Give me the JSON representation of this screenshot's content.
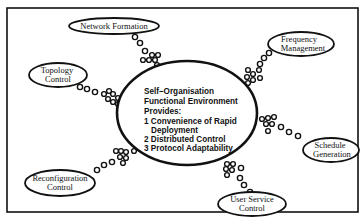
{
  "diagram": {
    "type": "hub-and-spoke",
    "center": {
      "title_lines": [
        "Self–Organisation",
        "Functional Environment",
        "Provides:"
      ],
      "items": [
        {
          "number": "1",
          "lines": [
            "Convenience of Rapid",
            "Deployment"
          ]
        },
        {
          "number": "2",
          "lines": [
            "Distributed Control"
          ]
        },
        {
          "number": "3",
          "lines": [
            "Protocol Adaptability"
          ]
        }
      ],
      "text_lines": [
        "Self–Organisation",
        "Functional Environment",
        "Provides:",
        "1 Convenience of Rapid",
        "Deployment",
        "2 Distributed Control",
        "3 Protocol Adaptability"
      ]
    },
    "nodes": [
      {
        "id": "network-formation",
        "lines": [
          "Network Formation"
        ]
      },
      {
        "id": "frequency-management",
        "lines": [
          "Frequency",
          "Management"
        ]
      },
      {
        "id": "topology-control",
        "lines": [
          "Topology",
          "Control"
        ]
      },
      {
        "id": "schedule-generation",
        "lines": [
          "Schedule",
          "Generation"
        ]
      },
      {
        "id": "reconfiguration-control",
        "lines": [
          "Reconfiguration",
          "Control"
        ]
      },
      {
        "id": "user-service-control",
        "lines": [
          "User Service",
          "Control"
        ]
      }
    ],
    "connector_style": "chain of small circles (thought-bubble style)"
  }
}
